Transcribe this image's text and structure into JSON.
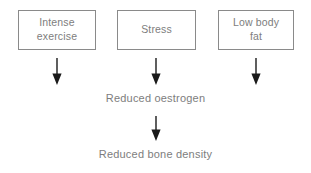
{
  "diagram": {
    "background_color": "#ffffff",
    "text_color": "#7d7d7d",
    "border_color": "#8a8a8a",
    "arrow_color": "#1a1a1a",
    "factors": [
      {
        "id": "intense-exercise",
        "label": "Intense\nexercise"
      },
      {
        "id": "stress",
        "label": "Stress"
      },
      {
        "id": "low-body-fat",
        "label": "Low body\nfat"
      }
    ],
    "arrows": [
      {
        "id": "exercise-to-oestrogen",
        "direction": "down",
        "icon": "arrow-down-icon"
      },
      {
        "id": "stress-to-oestrogen",
        "direction": "down",
        "icon": "arrow-down-icon"
      },
      {
        "id": "fat-to-oestrogen",
        "direction": "down",
        "icon": "arrow-down-icon"
      },
      {
        "id": "oestrogen-to-density",
        "direction": "down",
        "icon": "arrow-down-icon"
      }
    ],
    "outcomes": [
      {
        "id": "reduced-oestrogen",
        "label": "Reduced oestrogen"
      },
      {
        "id": "reduced-bone-density",
        "label": "Reduced bone density"
      }
    ]
  }
}
